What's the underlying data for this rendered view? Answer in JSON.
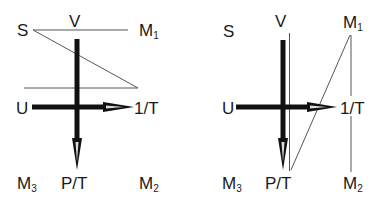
{
  "diagrams": [
    {
      "name": "left",
      "labels": {
        "top_left": "S",
        "top_center": "V",
        "top_right": "M",
        "top_right_sub": "1",
        "mid_left": "U",
        "mid_right": "1/T",
        "bottom_left": "M",
        "bottom_left_sub": "3",
        "bottom_center": "P/T",
        "bottom_right": "M",
        "bottom_right_sub": "2"
      }
    },
    {
      "name": "right",
      "labels": {
        "top_left": "S",
        "top_center": "V",
        "top_right": "M",
        "top_right_sub": "1",
        "mid_left": "U",
        "mid_right": "1/T",
        "bottom_left": "M",
        "bottom_left_sub": "3",
        "bottom_center": "P/T",
        "bottom_right": "M",
        "bottom_right_sub": "2"
      }
    }
  ],
  "colors": {
    "line": "#333333",
    "thin_line": "#555555",
    "text": "#1a1a1a"
  }
}
